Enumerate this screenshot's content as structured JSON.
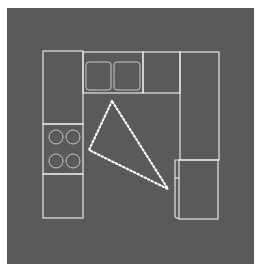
{
  "diagram": {
    "type": "kitchen-floor-plan",
    "colors": {
      "page": "#ffffff",
      "background": "#5a5a5a",
      "lines": "#e8e8e8",
      "fixtures": "#c8c8c8",
      "triangle": "#ffffff"
    },
    "elements": [
      {
        "id": "left-counter-top",
        "label": "Counter"
      },
      {
        "id": "cooktop",
        "label": "Cooktop (4 burners)"
      },
      {
        "id": "left-counter-bottom",
        "label": "Counter"
      },
      {
        "id": "sink",
        "label": "Double sink"
      },
      {
        "id": "top-counter",
        "label": "Counter"
      },
      {
        "id": "right-counter",
        "label": "Counter"
      },
      {
        "id": "refrigerator",
        "label": "Refrigerator"
      },
      {
        "id": "work-triangle",
        "label": "Work triangle (dotted)"
      }
    ]
  }
}
